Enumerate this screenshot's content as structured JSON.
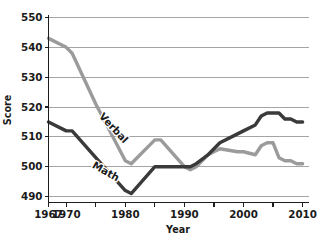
{
  "chart_data": {
    "type": "line",
    "title": "",
    "xlabel": "Year",
    "ylabel": "Score",
    "xlim": [
      1967,
      2011
    ],
    "ylim": [
      488,
      551
    ],
    "grid": true,
    "legend": "inline-labels",
    "x_tick_labels": [
      "1967",
      "1970",
      "1980",
      "1990",
      "2000",
      "2010"
    ],
    "x_tick_values": [
      1967,
      1970,
      1980,
      1990,
      2000,
      2010
    ],
    "y_tick_labels": [
      "490",
      "500",
      "510",
      "520",
      "530",
      "540",
      "550"
    ],
    "y_tick_values": [
      490,
      500,
      510,
      520,
      530,
      540,
      550
    ],
    "series": [
      {
        "name": "Verbal",
        "color": "#9b9b9b",
        "x": [
          1967,
          1970,
          1971,
          1975,
          1980,
          1981,
          1985,
          1986,
          1990,
          1991,
          1992,
          1994,
          1996,
          1999,
          2000,
          2002,
          2003,
          2004,
          2005,
          2006,
          2007,
          2008,
          2009,
          2010
        ],
        "values": [
          543,
          540,
          538,
          521,
          502,
          501,
          509,
          509,
          500,
          499,
          500,
          504,
          506,
          505,
          505,
          504,
          507,
          508,
          508,
          503,
          502,
          502,
          501,
          501
        ]
      },
      {
        "name": "Math",
        "color": "#3a3a3a",
        "x": [
          1967,
          1970,
          1971,
          1975,
          1980,
          1981,
          1985,
          1986,
          1990,
          1991,
          1992,
          1994,
          1996,
          1999,
          2000,
          2002,
          2003,
          2004,
          2005,
          2006,
          2007,
          2008,
          2009,
          2010
        ],
        "values": [
          515,
          512,
          512,
          503,
          492,
          491,
          500,
          500,
          500,
          500,
          501,
          504,
          508,
          511,
          512,
          514,
          517,
          518,
          518,
          518,
          516,
          516,
          515,
          515
        ]
      }
    ]
  },
  "labels": {
    "y_axis_title": "Score",
    "x_axis_title": "Year",
    "verbal_label": "Verbal",
    "math_label": "Math"
  }
}
